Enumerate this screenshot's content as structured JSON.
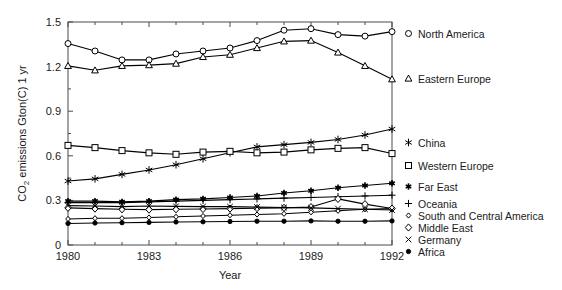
{
  "chart_data": {
    "type": "line",
    "title": "",
    "xlabel": "Year",
    "ylabel": "CO2 emissions Gton(C) 1 yr",
    "ylabel_parts": {
      "pre": "CO",
      "sub": "2",
      "post": " emissions Gton(C) 1 yr"
    },
    "xlim": [
      1980,
      1992
    ],
    "ylim": [
      0,
      1.5
    ],
    "x": [
      1980,
      1981,
      1982,
      1983,
      1984,
      1985,
      1986,
      1987,
      1988,
      1989,
      1990,
      1991,
      1992
    ],
    "xticks": [
      1980,
      1983,
      1986,
      1989,
      1992
    ],
    "xtick_labels": [
      "1980",
      "1983",
      "1986",
      "1989",
      "1992"
    ],
    "xminor_ticks": [
      1981,
      1982,
      1984,
      1985,
      1987,
      1988,
      1990,
      1991
    ],
    "yticks": [
      0,
      0.3,
      0.6,
      0.9,
      1.2,
      1.5
    ],
    "ytick_labels": [
      "0",
      "0.3",
      "0.6",
      "0.9",
      "1.2",
      "1.5"
    ],
    "yminor_ticks": [
      0.15,
      0.45,
      0.75,
      1.05,
      1.35
    ],
    "grid": false,
    "legend_position": "right",
    "series": [
      {
        "name": "North America",
        "marker": "circle-open",
        "values": [
          1.355,
          1.305,
          1.245,
          1.245,
          1.285,
          1.305,
          1.325,
          1.375,
          1.445,
          1.455,
          1.415,
          1.405,
          1.435
        ]
      },
      {
        "name": "Eastern Europe",
        "marker": "triangle-open",
        "values": [
          1.205,
          1.175,
          1.205,
          1.21,
          1.22,
          1.265,
          1.28,
          1.325,
          1.37,
          1.375,
          1.295,
          1.205,
          1.115
        ]
      },
      {
        "name": "China",
        "marker": "asterisk",
        "values": [
          0.43,
          0.445,
          0.475,
          0.505,
          0.54,
          0.58,
          0.62,
          0.66,
          0.675,
          0.69,
          0.71,
          0.74,
          0.78
        ]
      },
      {
        "name": "Western Europe",
        "marker": "square-open",
        "values": [
          0.67,
          0.655,
          0.635,
          0.62,
          0.61,
          0.625,
          0.63,
          0.62,
          0.625,
          0.64,
          0.65,
          0.655,
          0.615
        ]
      },
      {
        "name": "Far East",
        "marker": "star-solid",
        "values": [
          0.295,
          0.295,
          0.29,
          0.295,
          0.305,
          0.31,
          0.32,
          0.33,
          0.35,
          0.365,
          0.385,
          0.4,
          0.415
        ]
      },
      {
        "name": "Oceania",
        "marker": "plus",
        "values": [
          0.285,
          0.285,
          0.285,
          0.29,
          0.295,
          0.3,
          0.305,
          0.31,
          0.315,
          0.32,
          0.325,
          0.33,
          0.335
        ]
      },
      {
        "name": "South and Central America",
        "marker": "diamond-small",
        "values": [
          0.175,
          0.18,
          0.18,
          0.185,
          0.19,
          0.195,
          0.2,
          0.205,
          0.21,
          0.22,
          0.23,
          0.24,
          0.245
        ]
      },
      {
        "name": "Middle East",
        "marker": "diamond-open",
        "values": [
          0.25,
          0.245,
          0.24,
          0.238,
          0.24,
          0.242,
          0.245,
          0.248,
          0.25,
          0.255,
          0.31,
          0.275,
          0.245
        ]
      },
      {
        "name": "Germany",
        "marker": "cross",
        "values": [
          0.265,
          0.262,
          0.258,
          0.262,
          0.26,
          0.258,
          0.258,
          0.255,
          0.252,
          0.25,
          0.245,
          0.24,
          0.235
        ]
      },
      {
        "name": "Africa",
        "marker": "circle-solid",
        "values": [
          0.145,
          0.148,
          0.15,
          0.152,
          0.155,
          0.156,
          0.158,
          0.16,
          0.16,
          0.162,
          0.16,
          0.16,
          0.162
        ]
      }
    ]
  },
  "legend": {
    "items": [
      {
        "label": "North America",
        "marker": "circle-open",
        "y": 33
      },
      {
        "label": "Eastern Europe",
        "marker": "triangle-open",
        "y": 78
      },
      {
        "label": "China",
        "marker": "asterisk",
        "y": 142
      },
      {
        "label": "Western Europe",
        "marker": "square-open",
        "y": 165
      },
      {
        "label": "Far East",
        "marker": "star-solid",
        "y": 186
      },
      {
        "label": "Oceania",
        "marker": "plus",
        "y": 203
      },
      {
        "label": "South and Central America",
        "marker": "diamond-small",
        "y": 215
      },
      {
        "label": "Middle East",
        "marker": "diamond-open",
        "y": 227
      },
      {
        "label": "Germany",
        "marker": "cross",
        "y": 239
      },
      {
        "label": "Africa",
        "marker": "circle-solid",
        "y": 251
      }
    ]
  }
}
